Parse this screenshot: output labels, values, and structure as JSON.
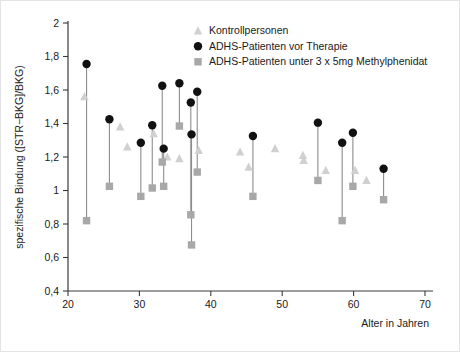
{
  "chart_data": {
    "type": "scatter",
    "title": "",
    "xlabel": "Alter in Jahren",
    "ylabel": "spezifische Bindung ([STR−BKG]/BKG)",
    "xlim": [
      20,
      70
    ],
    "ylim": [
      0.4,
      2
    ],
    "xticks": [
      "20",
      "30",
      "40",
      "50",
      "60",
      "70"
    ],
    "xtick_values": [
      20,
      30,
      40,
      50,
      60,
      70
    ],
    "yticks": [
      "0,4",
      "0,6",
      "0,8",
      "1",
      "1,2",
      "1,4",
      "1,6",
      "1,8",
      "2"
    ],
    "ytick_values": [
      0.4,
      0.6,
      0.8,
      1.0,
      1.2,
      1.4,
      1.6,
      1.8,
      2.0
    ],
    "grid": false,
    "legend_position": "top-center",
    "series": [
      {
        "name": "Kontrollpersonen",
        "marker": "triangle",
        "color": "#d0d0d0",
        "points": [
          {
            "x": 22.3,
            "y": 1.56
          },
          {
            "x": 27.3,
            "y": 1.38
          },
          {
            "x": 28.3,
            "y": 1.26
          },
          {
            "x": 32.0,
            "y": 1.34
          },
          {
            "x": 33.9,
            "y": 1.2
          },
          {
            "x": 35.6,
            "y": 1.19
          },
          {
            "x": 38.3,
            "y": 1.24
          },
          {
            "x": 44.1,
            "y": 1.23
          },
          {
            "x": 45.3,
            "y": 1.14
          },
          {
            "x": 49.0,
            "y": 1.25
          },
          {
            "x": 52.9,
            "y": 1.21
          },
          {
            "x": 53.0,
            "y": 1.18
          },
          {
            "x": 56.1,
            "y": 1.12
          },
          {
            "x": 60.2,
            "y": 1.12
          },
          {
            "x": 61.8,
            "y": 1.06
          }
        ]
      },
      {
        "name": "ADHS-Patienten vor Therapie",
        "marker": "circle",
        "color": "#111111",
        "points": [
          {
            "x": 22.6,
            "y": 1.755
          },
          {
            "x": 25.8,
            "y": 1.425
          },
          {
            "x": 30.2,
            "y": 1.285
          },
          {
            "x": 31.8,
            "y": 1.39
          },
          {
            "x": 33.2,
            "y": 1.625
          },
          {
            "x": 33.4,
            "y": 1.25
          },
          {
            "x": 35.6,
            "y": 1.64
          },
          {
            "x": 37.2,
            "y": 1.525
          },
          {
            "x": 37.3,
            "y": 1.335
          },
          {
            "x": 38.1,
            "y": 1.59
          },
          {
            "x": 45.9,
            "y": 1.325
          },
          {
            "x": 55.0,
            "y": 1.405
          },
          {
            "x": 58.4,
            "y": 1.285
          },
          {
            "x": 59.9,
            "y": 1.345
          },
          {
            "x": 64.2,
            "y": 1.13
          }
        ]
      },
      {
        "name": "ADHS-Patienten unter 3 x 5mg Methylphenidat",
        "marker": "square",
        "color": "#a8a8a8",
        "points": [
          {
            "x": 22.6,
            "y": 0.82
          },
          {
            "x": 25.8,
            "y": 1.025
          },
          {
            "x": 30.2,
            "y": 0.965
          },
          {
            "x": 31.8,
            "y": 1.015
          },
          {
            "x": 33.2,
            "y": 1.17
          },
          {
            "x": 33.4,
            "y": 1.025
          },
          {
            "x": 35.6,
            "y": 1.385
          },
          {
            "x": 37.2,
            "y": 0.855
          },
          {
            "x": 37.3,
            "y": 0.675
          },
          {
            "x": 38.1,
            "y": 1.11
          },
          {
            "x": 45.9,
            "y": 0.965
          },
          {
            "x": 55.0,
            "y": 1.06
          },
          {
            "x": 58.4,
            "y": 0.82
          },
          {
            "x": 59.9,
            "y": 1.025
          },
          {
            "x": 64.2,
            "y": 0.945
          }
        ]
      }
    ],
    "connectors": [
      {
        "x": 22.6,
        "y_top": 1.755,
        "y_bottom": 0.82
      },
      {
        "x": 25.8,
        "y_top": 1.425,
        "y_bottom": 1.025
      },
      {
        "x": 30.2,
        "y_top": 1.285,
        "y_bottom": 0.965
      },
      {
        "x": 31.8,
        "y_top": 1.39,
        "y_bottom": 1.015
      },
      {
        "x": 33.2,
        "y_top": 1.625,
        "y_bottom": 1.17
      },
      {
        "x": 33.4,
        "y_top": 1.25,
        "y_bottom": 1.025
      },
      {
        "x": 35.6,
        "y_top": 1.64,
        "y_bottom": 1.385
      },
      {
        "x": 37.2,
        "y_top": 1.525,
        "y_bottom": 0.855
      },
      {
        "x": 37.3,
        "y_top": 1.335,
        "y_bottom": 0.675
      },
      {
        "x": 38.1,
        "y_top": 1.59,
        "y_bottom": 1.11
      },
      {
        "x": 45.9,
        "y_top": 1.325,
        "y_bottom": 0.965
      },
      {
        "x": 55.0,
        "y_top": 1.405,
        "y_bottom": 1.06
      },
      {
        "x": 58.4,
        "y_top": 1.285,
        "y_bottom": 0.82
      },
      {
        "x": 59.9,
        "y_top": 1.345,
        "y_bottom": 1.025
      },
      {
        "x": 64.2,
        "y_top": 1.13,
        "y_bottom": 0.945
      }
    ]
  },
  "legend": {
    "items": [
      {
        "label": "Kontrollpersonen",
        "marker": "triangle",
        "color": "#d0d0d0"
      },
      {
        "label": "ADHS-Patienten vor Therapie",
        "marker": "circle",
        "color": "#111111"
      },
      {
        "label": "ADHS-Patienten unter 3 x 5mg Methylphenidat",
        "marker": "square",
        "color": "#a8a8a8"
      }
    ]
  }
}
